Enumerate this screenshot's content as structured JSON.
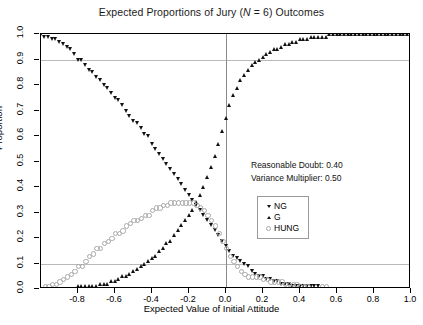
{
  "chart_data": {
    "type": "scatter",
    "title": "Expected Proportions of Jury (N = 6) Outcomes",
    "title_prefix": "Expected Proportions of Jury (",
    "title_italic": "N",
    "title_suffix": " = 6) Outcomes",
    "xlabel": "Expected Value of Initial Attitude",
    "ylabel": "Proportion",
    "xlim": [
      -1.0,
      1.0
    ],
    "ylim": [
      0.0,
      1.0
    ],
    "xticks": [
      -0.8,
      -0.6,
      -0.4,
      -0.2,
      0.0,
      0.2,
      0.4,
      0.6,
      0.8,
      1.0
    ],
    "xtick_labels": [
      "-0.8",
      "-0.6",
      "-0.4",
      "-0.2",
      "0.0",
      "0.2",
      "0.4",
      "0.6",
      "0.8",
      "1.0"
    ],
    "yticks": [
      0.0,
      0.1,
      0.2,
      0.3,
      0.4,
      0.5,
      0.6,
      0.7,
      0.8,
      0.9,
      1.0
    ],
    "ytick_labels": [
      "0.0",
      "0.1",
      "0.2",
      "0.3",
      "0.4",
      "0.5",
      "0.6",
      "0.7",
      "0.8",
      "0.9",
      "1.0"
    ],
    "grid": {
      "horizontal": [
        0.1,
        0.9
      ],
      "vertical": [
        0.0
      ],
      "color": "#b9b9b9"
    },
    "legend": {
      "position": "center-right",
      "entries": [
        {
          "label": "NG",
          "marker": "triangle-down",
          "color": "#111111"
        },
        {
          "label": "G",
          "marker": "triangle-up",
          "color": "#111111"
        },
        {
          "label": "HUNG",
          "marker": "circle-open",
          "color": "#a9a9a9"
        }
      ]
    },
    "annotations": [
      {
        "text": "Reasonable Doubt: 0.40"
      },
      {
        "text": "Variance Multiplier: 0.50"
      }
    ],
    "x": [
      -1.0,
      -0.98,
      -0.96,
      -0.94,
      -0.92,
      -0.9,
      -0.88,
      -0.86,
      -0.84,
      -0.82,
      -0.8,
      -0.78,
      -0.76,
      -0.74,
      -0.72,
      -0.7,
      -0.68,
      -0.66,
      -0.64,
      -0.62,
      -0.6,
      -0.58,
      -0.56,
      -0.54,
      -0.52,
      -0.5,
      -0.48,
      -0.46,
      -0.44,
      -0.42,
      -0.4,
      -0.38,
      -0.36,
      -0.34,
      -0.32,
      -0.3,
      -0.28,
      -0.26,
      -0.24,
      -0.22,
      -0.2,
      -0.18,
      -0.16,
      -0.14,
      -0.12,
      -0.1,
      -0.08,
      -0.06,
      -0.04,
      -0.02,
      0.0,
      0.02,
      0.04,
      0.06,
      0.08,
      0.1,
      0.12,
      0.14,
      0.16,
      0.18,
      0.2,
      0.22,
      0.24,
      0.26,
      0.28,
      0.3,
      0.32,
      0.34,
      0.36,
      0.38,
      0.4,
      0.42,
      0.44,
      0.46,
      0.48,
      0.5,
      0.52,
      0.54,
      0.56,
      0.58,
      0.6,
      0.62,
      0.64,
      0.66,
      0.68,
      0.7,
      0.72,
      0.74,
      0.76,
      0.78,
      0.8,
      0.82,
      0.84,
      0.86,
      0.88,
      0.9,
      0.92,
      0.94,
      0.96,
      0.98,
      1.0
    ],
    "series": [
      {
        "name": "NG",
        "marker": "triangle-down",
        "color": "#111111",
        "values": [
          1.0,
          0.99,
          0.99,
          0.98,
          0.98,
          0.97,
          0.96,
          0.95,
          0.94,
          0.92,
          0.9,
          0.9,
          0.88,
          0.86,
          0.85,
          0.83,
          0.82,
          0.8,
          0.79,
          0.77,
          0.75,
          0.74,
          0.72,
          0.7,
          0.68,
          0.66,
          0.65,
          0.63,
          0.61,
          0.6,
          0.57,
          0.55,
          0.53,
          0.51,
          0.49,
          0.47,
          0.45,
          0.43,
          0.41,
          0.39,
          0.37,
          0.35,
          0.33,
          0.31,
          0.29,
          0.27,
          0.25,
          0.23,
          0.21,
          0.19,
          0.17,
          0.15,
          0.13,
          0.12,
          0.11,
          0.1,
          0.09,
          0.07,
          0.06,
          0.05,
          0.05,
          0.04,
          0.04,
          0.03,
          0.03,
          0.02,
          0.02,
          0.02,
          0.01,
          0.01,
          0.01,
          0.01,
          0.01,
          0.01,
          0.01,
          0.01,
          0.0,
          0.0,
          0.0,
          0.0,
          0.0,
          0.0,
          0.0,
          0.0,
          0.0,
          0.0,
          0.0,
          0.0,
          0.0,
          0.0,
          0.0,
          0.0,
          0.0,
          0.0,
          0.0,
          0.0,
          0.0,
          0.0,
          0.0,
          0.0,
          0.0
        ]
      },
      {
        "name": "G",
        "marker": "triangle-up",
        "color": "#111111",
        "values": [
          0.0,
          0.0,
          0.0,
          0.0,
          0.0,
          0.0,
          0.0,
          0.0,
          0.0,
          0.0,
          0.01,
          0.01,
          0.01,
          0.01,
          0.01,
          0.01,
          0.02,
          0.02,
          0.02,
          0.03,
          0.03,
          0.04,
          0.05,
          0.05,
          0.06,
          0.07,
          0.08,
          0.09,
          0.1,
          0.11,
          0.12,
          0.13,
          0.15,
          0.16,
          0.18,
          0.19,
          0.21,
          0.23,
          0.25,
          0.27,
          0.29,
          0.31,
          0.34,
          0.37,
          0.4,
          0.44,
          0.48,
          0.52,
          0.57,
          0.62,
          0.67,
          0.72,
          0.76,
          0.79,
          0.82,
          0.84,
          0.86,
          0.88,
          0.89,
          0.9,
          0.91,
          0.92,
          0.93,
          0.94,
          0.94,
          0.95,
          0.96,
          0.96,
          0.97,
          0.97,
          0.98,
          0.98,
          0.98,
          0.99,
          0.99,
          0.99,
          0.99,
          0.99,
          1.0,
          1.0,
          1.0,
          1.0,
          1.0,
          1.0,
          1.0,
          1.0,
          1.0,
          1.0,
          1.0,
          1.0,
          1.0,
          1.0,
          1.0,
          1.0,
          1.0,
          1.0,
          1.0,
          1.0,
          1.0,
          1.0,
          1.0
        ]
      },
      {
        "name": "HUNG",
        "marker": "circle-open",
        "color": "#a9a9a9",
        "values": [
          0.0,
          0.01,
          0.01,
          0.02,
          0.02,
          0.03,
          0.04,
          0.05,
          0.06,
          0.07,
          0.09,
          0.09,
          0.11,
          0.13,
          0.14,
          0.16,
          0.16,
          0.18,
          0.19,
          0.2,
          0.22,
          0.22,
          0.23,
          0.25,
          0.26,
          0.27,
          0.27,
          0.28,
          0.29,
          0.29,
          0.31,
          0.32,
          0.32,
          0.33,
          0.33,
          0.34,
          0.34,
          0.34,
          0.34,
          0.34,
          0.34,
          0.34,
          0.33,
          0.32,
          0.31,
          0.29,
          0.27,
          0.25,
          0.22,
          0.19,
          0.16,
          0.13,
          0.11,
          0.09,
          0.07,
          0.06,
          0.05,
          0.05,
          0.05,
          0.05,
          0.04,
          0.04,
          0.03,
          0.03,
          0.03,
          0.03,
          0.02,
          0.02,
          0.02,
          0.02,
          0.01,
          0.01,
          0.01,
          0.0,
          0.0,
          0.0,
          0.01,
          0.01,
          0.0,
          0.0,
          0.0,
          0.0,
          0.0,
          0.0,
          0.0,
          0.0,
          0.0,
          0.0,
          0.0,
          0.0,
          0.0,
          0.0,
          0.0,
          0.0,
          0.0,
          0.0,
          0.0,
          0.0,
          0.0,
          0.0,
          0.0
        ]
      }
    ]
  }
}
